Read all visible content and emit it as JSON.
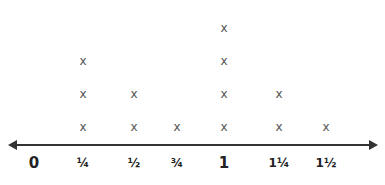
{
  "chart_data": {
    "type": "dot_plot",
    "title": "",
    "xlabel": "",
    "ylabel": "",
    "marker": "X",
    "categories": [
      "0",
      "¼",
      "½",
      "¾",
      "1",
      "1¼",
      "1½"
    ],
    "x": [
      0,
      0.25,
      0.5,
      0.75,
      1,
      1.25,
      1.5
    ],
    "values": [
      0,
      3,
      2,
      1,
      4,
      2,
      1
    ],
    "grid": false,
    "legend": null
  },
  "ticks": [
    {
      "label": "0",
      "x": 34,
      "style": "big"
    },
    {
      "label": "¼",
      "x": 83,
      "style": "frac"
    },
    {
      "label": "½",
      "x": 134,
      "style": "frac"
    },
    {
      "label": "¾",
      "x": 177,
      "style": "frac"
    },
    {
      "label": "1",
      "x": 224,
      "style": "big"
    },
    {
      "label": "1¼",
      "x": 279,
      "style": "frac"
    },
    {
      "label": "1½",
      "x": 326,
      "style": "frac"
    }
  ],
  "marker_glyph": "x"
}
